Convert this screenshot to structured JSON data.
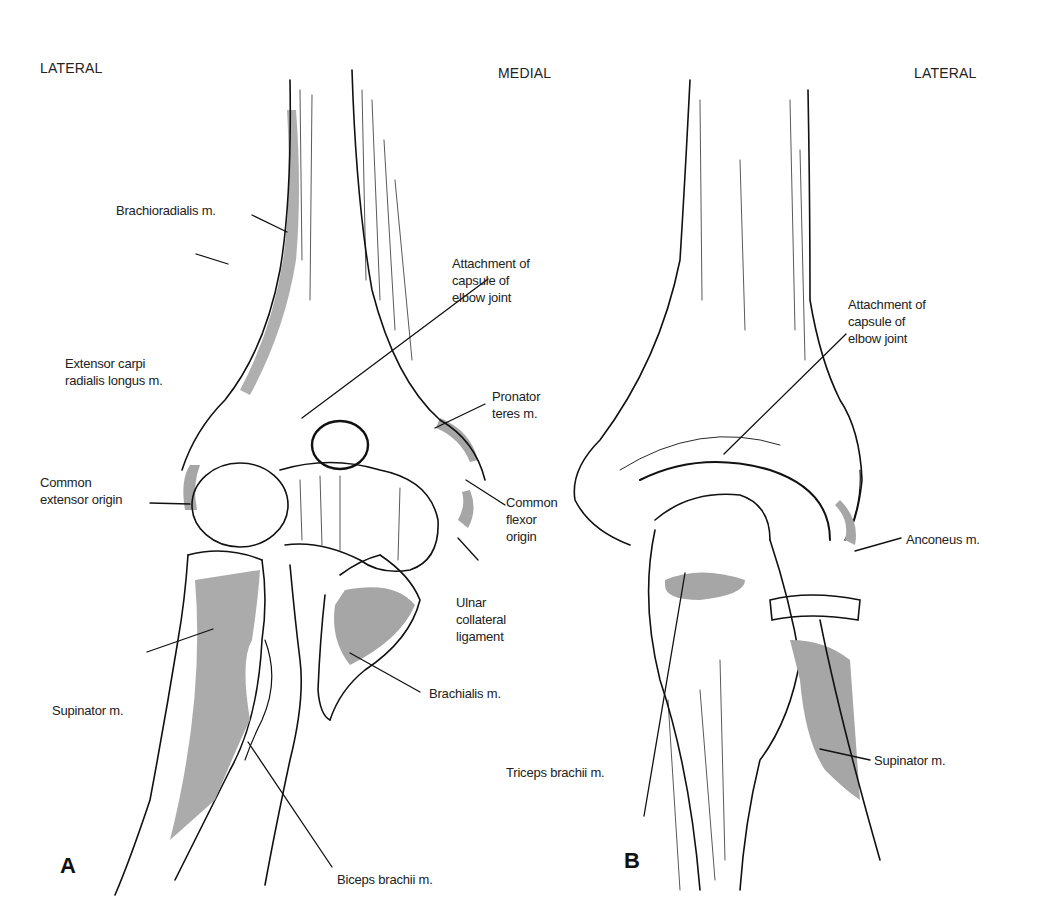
{
  "orientation": {
    "a_left": "LATERAL",
    "a_right": "MEDIAL",
    "b_right": "LATERAL"
  },
  "panels": {
    "a": "A",
    "b": "B"
  },
  "figure_a": {
    "labels": {
      "brachioradialis": "Brachioradialis m.",
      "ecrl": "Extensor carpi\nradialis longus m.",
      "common_extensor": "Common\nextensor origin",
      "capsule": "Attachment of\ncapsule of\nelbow joint",
      "pronator": "Pronator\nteres m.",
      "common_flexor": "Common\nflexor\norigin",
      "ulnar_collateral": "Ulnar\ncollateral\nligament",
      "supinator": "Supinator m.",
      "brachialis": "Brachialis m.",
      "biceps": "Biceps brachii m."
    }
  },
  "figure_b": {
    "labels": {
      "capsule": "Attachment of\ncapsule of\nelbow joint",
      "anconeus": "Anconeus m.",
      "triceps": "Triceps brachii m.",
      "supinator": "Supinator m."
    }
  },
  "colors": {
    "ink": "#111111",
    "muscle_shade": "#a6a6a6",
    "background": "#ffffff"
  }
}
